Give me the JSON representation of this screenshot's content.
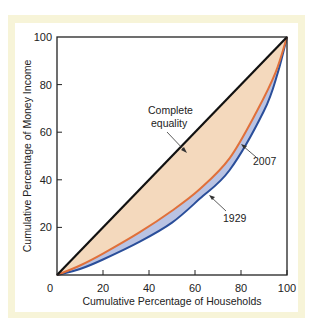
{
  "chart_data": {
    "type": "line",
    "title": "",
    "xlabel": "Cumulative Percentage of Households",
    "ylabel": "Cumulative Percentage of Money Income",
    "xlim": [
      0,
      100
    ],
    "ylim": [
      0,
      100
    ],
    "x_ticks": [
      "0",
      "20",
      "40",
      "60",
      "80",
      "100"
    ],
    "y_ticks": [
      "20",
      "40",
      "60",
      "80",
      "100"
    ],
    "grid": false,
    "legend": "none (direct labels)",
    "series": [
      {
        "name": "Complete equality",
        "color": "#111111",
        "x": [
          0,
          100
        ],
        "y": [
          0,
          100
        ]
      },
      {
        "name": "2007",
        "color": "#e0703a",
        "x": [
          0,
          10,
          20,
          36,
          50,
          62,
          75,
          87,
          95,
          100
        ],
        "y": [
          0,
          4,
          9,
          18,
          27,
          36,
          49,
          69,
          85,
          100
        ]
      },
      {
        "name": "1929",
        "color": "#2a4e9a",
        "x": [
          0,
          10,
          20,
          36,
          50,
          62,
          75,
          90,
          96,
          100
        ],
        "y": [
          0,
          2.5,
          6.5,
          14,
          22,
          32,
          44,
          69,
          85,
          100
        ]
      }
    ],
    "fills": [
      {
        "between": [
          "Complete equality",
          "2007"
        ],
        "color": "#f4d9bd"
      },
      {
        "between": [
          "2007",
          "1929"
        ],
        "color": "#b9c3e3"
      }
    ],
    "annotations": [
      {
        "text_lines": [
          "Complete",
          "equality"
        ],
        "target_series": "Complete equality"
      },
      {
        "text_lines": [
          "2007"
        ],
        "target_series": "2007"
      },
      {
        "text_lines": [
          "1929"
        ],
        "target_series": "1929"
      }
    ]
  },
  "labels": {
    "x_axis": "Cumulative Percentage of Households",
    "y_axis": "Cumulative Percentage of Money Income",
    "origin": "0",
    "equality_line1": "Complete",
    "equality_line2": "equality",
    "year_2007": "2007",
    "year_1929": "1929"
  }
}
